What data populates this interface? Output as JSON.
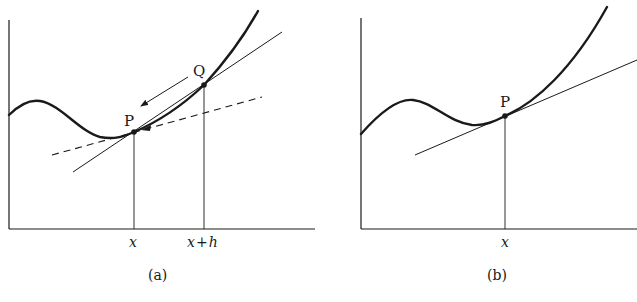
{
  "figure": {
    "panels": [
      {
        "id": "a",
        "caption": "(a)",
        "points": [
          {
            "label": "P",
            "x_label": "x"
          },
          {
            "label": "Q",
            "x_label": "x + h"
          }
        ],
        "lines": [
          "curve",
          "secant PQ",
          "tangent at P (dashed)",
          "arrow Q→P"
        ]
      },
      {
        "id": "b",
        "caption": "(b)",
        "points": [
          {
            "label": "P",
            "x_label": "x"
          }
        ],
        "lines": [
          "curve",
          "tangent at P"
        ]
      }
    ]
  },
  "panel_a": {
    "caption": "(a)",
    "point_p": "P",
    "point_q": "Q",
    "tick_x": "x",
    "tick_xh_x": "x",
    "tick_xh_plus": "+",
    "tick_xh_h": "h"
  },
  "panel_b": {
    "caption": "(b)",
    "point_p": "P",
    "tick_x": "x"
  },
  "colors": {
    "ink": "#1a1a1a",
    "background": "#ffffff"
  }
}
